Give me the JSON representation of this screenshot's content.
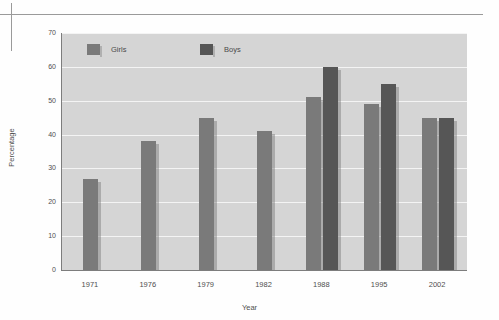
{
  "chart_data": {
    "type": "bar",
    "title": "",
    "xlabel": "Year",
    "ylabel": "Percentage",
    "categories": [
      "1971",
      "1976",
      "1979",
      "1982",
      "1988",
      "1995",
      "2002"
    ],
    "ylim": [
      0,
      70
    ],
    "yticks": [
      "0",
      "10",
      "20",
      "30",
      "40",
      "50",
      "60",
      "70"
    ],
    "ytick_values": [
      0,
      10,
      20,
      30,
      40,
      50,
      60,
      70
    ],
    "grid": true,
    "legend_position": "top-inside",
    "series": [
      {
        "name": "Girls",
        "color": "#7a7a7a",
        "values": [
          27,
          38,
          45,
          41,
          51,
          49,
          45
        ]
      },
      {
        "name": "Boys",
        "color": "#565656",
        "values": [
          null,
          null,
          null,
          null,
          60,
          55,
          45
        ]
      }
    ]
  },
  "colors": {
    "plot_background": "#d5d5d5",
    "gridline": "#f4f4f4",
    "axis": "#7d7d7d",
    "girls": "#7a7a7a",
    "boys": "#565656",
    "text": "#4f4f4f",
    "page_background": "#fefefe",
    "registration_mark": "#9a9a9a"
  }
}
